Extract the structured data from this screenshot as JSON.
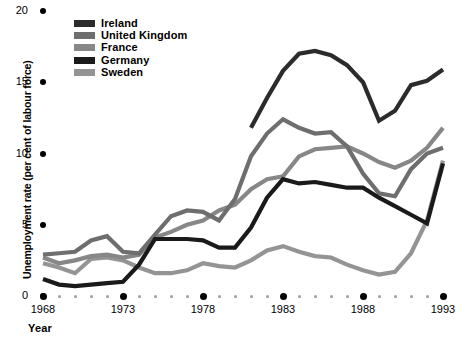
{
  "chart_data": {
    "type": "line",
    "title": "",
    "xlabel": "Year",
    "ylabel": "Unemployment rate (per cent of labour force)",
    "xlim": [
      1968,
      1993
    ],
    "ylim": [
      0,
      20
    ],
    "yticks": [
      0,
      5,
      10,
      15,
      20
    ],
    "ytick_labels": [
      "0",
      "5",
      "10",
      "15",
      "20"
    ],
    "xticks": [
      1968,
      1973,
      1978,
      1983,
      1988,
      1993
    ],
    "xtick_labels": [
      "1968",
      "1973",
      "1978",
      "1983",
      "1988",
      "1993"
    ],
    "x": [
      1968,
      1969,
      1970,
      1971,
      1972,
      1973,
      1974,
      1975,
      1976,
      1977,
      1978,
      1979,
      1980,
      1981,
      1982,
      1983,
      1984,
      1985,
      1986,
      1987,
      1988,
      1989,
      1990,
      1991,
      1992,
      1993
    ],
    "grid": false,
    "legend_position": "top-center",
    "series": [
      {
        "name": "Ireland",
        "color": "#2b2b2b",
        "x": [
          1981,
          1982,
          1983,
          1984,
          1985,
          1986,
          1987,
          1988,
          1989,
          1990,
          1991,
          1992,
          1993
        ],
        "values": [
          11.8,
          13.9,
          15.8,
          17.0,
          17.2,
          16.9,
          16.2,
          15.0,
          12.3,
          13.0,
          14.8,
          15.1,
          15.9
        ]
      },
      {
        "name": "United Kingdom",
        "color": "#6e6e6e",
        "x": [
          1968,
          1969,
          1970,
          1971,
          1972,
          1973,
          1974,
          1975,
          1976,
          1977,
          1978,
          1979,
          1980,
          1981,
          1982,
          1983,
          1984,
          1985,
          1986,
          1987,
          1988,
          1989,
          1990,
          1991,
          1992,
          1993
        ],
        "values": [
          2.9,
          3.0,
          3.1,
          3.9,
          4.2,
          3.1,
          3.0,
          4.3,
          5.6,
          6.0,
          5.9,
          5.3,
          6.8,
          9.8,
          11.4,
          12.4,
          11.8,
          11.4,
          11.5,
          10.5,
          8.6,
          7.2,
          7.0,
          8.9,
          10.0,
          10.4
        ]
      },
      {
        "name": "France",
        "color": "#878787",
        "x": [
          1968,
          1969,
          1970,
          1971,
          1972,
          1973,
          1974,
          1975,
          1976,
          1977,
          1978,
          1979,
          1980,
          1981,
          1982,
          1983,
          1984,
          1985,
          1986,
          1987,
          1988,
          1989,
          1990,
          1991,
          1992,
          1993
        ],
        "values": [
          2.7,
          2.3,
          2.5,
          2.8,
          2.9,
          2.7,
          2.9,
          4.1,
          4.5,
          5.0,
          5.3,
          6.0,
          6.4,
          7.5,
          8.2,
          8.4,
          9.8,
          10.3,
          10.4,
          10.5,
          10.0,
          9.4,
          9.0,
          9.5,
          10.4,
          11.8
        ]
      },
      {
        "name": "Germany",
        "color": "#1a1a1a",
        "x": [
          1968,
          1969,
          1970,
          1971,
          1972,
          1973,
          1974,
          1975,
          1976,
          1977,
          1978,
          1979,
          1980,
          1981,
          1982,
          1983,
          1984,
          1985,
          1986,
          1987,
          1988,
          1989,
          1990,
          1991,
          1992,
          1993
        ],
        "values": [
          1.2,
          0.8,
          0.7,
          0.8,
          0.9,
          1.0,
          2.2,
          4.0,
          4.0,
          4.0,
          3.9,
          3.4,
          3.4,
          4.8,
          6.9,
          8.2,
          7.9,
          8.0,
          7.8,
          7.6,
          7.6,
          6.9,
          6.3,
          5.7,
          5.1,
          9.3
        ]
      },
      {
        "name": "Sweden",
        "color": "#949494",
        "x": [
          1968,
          1969,
          1970,
          1971,
          1972,
          1973,
          1974,
          1975,
          1976,
          1977,
          1978,
          1979,
          1980,
          1981,
          1982,
          1983,
          1984,
          1985,
          1986,
          1987,
          1988,
          1989,
          1990,
          1991,
          1992,
          1993
        ],
        "values": [
          2.3,
          2.0,
          1.6,
          2.6,
          2.7,
          2.5,
          2.0,
          1.6,
          1.6,
          1.8,
          2.3,
          2.1,
          2.0,
          2.5,
          3.2,
          3.5,
          3.1,
          2.8,
          2.7,
          2.2,
          1.8,
          1.5,
          1.7,
          3.0,
          5.3,
          9.5
        ]
      }
    ]
  },
  "legend": {
    "items": [
      {
        "label": "Ireland",
        "color": "#2b2b2b"
      },
      {
        "label": "United Kingdom",
        "color": "#6e6e6e"
      },
      {
        "label": "France",
        "color": "#878787"
      },
      {
        "label": "Germany",
        "color": "#1a1a1a"
      },
      {
        "label": "Sweden",
        "color": "#949494"
      }
    ]
  },
  "axes": {
    "y_title": "Unemployment rate (per cent of labour force)",
    "x_title": "Year"
  }
}
